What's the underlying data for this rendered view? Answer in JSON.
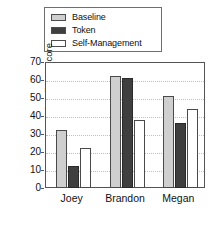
{
  "chart_data": {
    "type": "bar",
    "title": "",
    "xlabel": "",
    "ylabel": "Slide Effects Score",
    "categories": [
      "Joey",
      "Brandon",
      "Megan"
    ],
    "series": [
      {
        "name": "Baseline",
        "color": "#cfcfcf",
        "values": [
          32,
          62,
          51
        ]
      },
      {
        "name": "Token",
        "color": "#3f3f3f",
        "values": [
          12,
          61,
          36
        ]
      },
      {
        "name": "Self-Management",
        "color": "#ffffff",
        "values": [
          22,
          38,
          44
        ]
      }
    ],
    "ylim": [
      0,
      70
    ],
    "yticks": [
      0,
      10,
      20,
      30,
      40,
      50,
      60,
      70
    ],
    "ytick_labels": [
      "0",
      "10",
      "20",
      "30",
      "40",
      "50",
      "60",
      "70"
    ],
    "grid": "horizontal-dotted",
    "legend_position": "above-plot"
  },
  "legend": {
    "items": [
      {
        "label": "Baseline",
        "color": "#cfcfcf"
      },
      {
        "label": "Token",
        "color": "#3f3f3f"
      },
      {
        "label": "Self-Management",
        "color": "#ffffff"
      }
    ]
  },
  "axes": {
    "y_title": "Slide Effects Score",
    "y_labels": [
      "70",
      "60",
      "50",
      "40",
      "30",
      "20",
      "10",
      "0"
    ],
    "x_labels": [
      "Joey",
      "Brandon",
      "Megan"
    ]
  }
}
